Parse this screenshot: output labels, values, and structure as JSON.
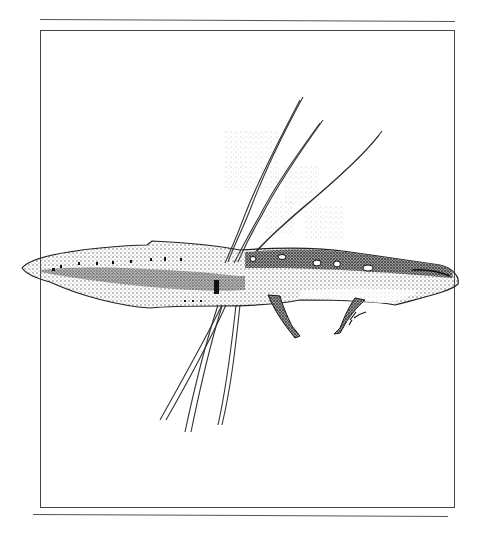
{
  "illustration": {
    "subject": "newt",
    "style": "pen-and-ink stipple drawing",
    "elements": [
      "top-rule",
      "frame",
      "grass-blades",
      "newt",
      "signature",
      "bottom-rule"
    ],
    "colors": {
      "ink": "#1a1a1a",
      "stipple": "#6b6b6b",
      "paper": "#ffffff",
      "rule": "#555555"
    }
  }
}
